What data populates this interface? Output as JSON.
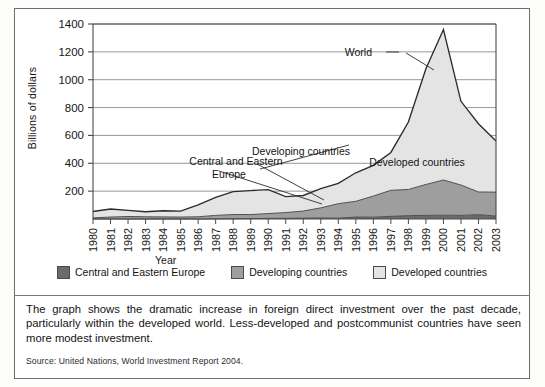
{
  "figure": {
    "y_axis_title": "Billions of dollars",
    "x_axis_title": "Year",
    "caption": "The graph shows the dramatic increase in foreign direct investment over the past decade, particularly within the developed world. Less-developed and postcommunist countries have seen more modest investment.",
    "source": "Source: United Nations, World Investment Report 2004."
  },
  "legend": {
    "entries": [
      {
        "label": "Central and Eastern Europe",
        "color": "#6b6b6b"
      },
      {
        "label": "Developing countries",
        "color": "#9e9e9e"
      },
      {
        "label": "Developed countries",
        "color": "#e4e4e4"
      }
    ]
  },
  "annotations": [
    {
      "name": "world",
      "text": "World"
    },
    {
      "name": "developing-countries",
      "text": "Developing countries"
    },
    {
      "name": "developed-countries",
      "text": "Developed countries"
    },
    {
      "name": "central-and-eastern-europe-line1",
      "text": "Central and Eastern"
    },
    {
      "name": "central-and-eastern-europe-line2",
      "text": "Europe"
    }
  ],
  "chart_data": {
    "type": "area",
    "stacked": true,
    "title": "",
    "xlabel": "Year",
    "ylabel": "Billions of dollars",
    "xlim": [
      1980,
      2003
    ],
    "ylim": [
      0,
      1400
    ],
    "yticks": [
      0,
      200,
      400,
      600,
      800,
      1000,
      1200,
      1400
    ],
    "ytick_labels": [
      "",
      "200",
      "400",
      "600",
      "800",
      "1000",
      "1200",
      "1400"
    ],
    "grid": true,
    "legend_position": "bottom",
    "categories": [
      "1980",
      "1981",
      "1982",
      "1983",
      "1984",
      "1985",
      "1986",
      "1987",
      "1988",
      "1989",
      "1990",
      "1991",
      "1992",
      "1993",
      "1994",
      "1995",
      "1996",
      "1997",
      "1998",
      "1999",
      "2000",
      "2001",
      "2002",
      "2003"
    ],
    "series": [
      {
        "name": "Central and Eastern Europe",
        "color": "#6b6b6b",
        "values": [
          0,
          0,
          0,
          0,
          0,
          0,
          0,
          1,
          2,
          3,
          4,
          5,
          6,
          7,
          6,
          14,
          13,
          19,
          24,
          26,
          27,
          26,
          31,
          21
        ]
      },
      {
        "name": "Developing countries",
        "color": "#9e9e9e",
        "values": [
          8,
          14,
          18,
          16,
          15,
          14,
          16,
          25,
          30,
          29,
          35,
          41,
          51,
          73,
          104,
          113,
          152,
          187,
          188,
          222,
          253,
          218,
          163,
          172
        ]
      },
      {
        "name": "Developed countries",
        "color": "#e4e4e4",
        "values": [
          46,
          58,
          44,
          36,
          44,
          43,
          85,
          129,
          165,
          172,
          172,
          115,
          112,
          138,
          146,
          205,
          220,
          272,
          484,
          830,
          1080,
          601,
          490,
          367
        ]
      }
    ],
    "total_series": {
      "name": "World",
      "values": [
        54,
        72,
        62,
        52,
        59,
        57,
        101,
        155,
        197,
        204,
        211,
        161,
        169,
        218,
        256,
        332,
        385,
        478,
        696,
        1078,
        1360,
        845,
        684,
        560
      ]
    }
  }
}
